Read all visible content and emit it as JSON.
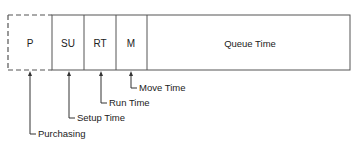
{
  "diagram": {
    "segments": [
      {
        "id": "p",
        "label": "P",
        "style": "dashed"
      },
      {
        "id": "su",
        "label": "SU",
        "style": "solid"
      },
      {
        "id": "rt",
        "label": "RT",
        "style": "solid"
      },
      {
        "id": "m",
        "label": "M",
        "style": "solid"
      },
      {
        "id": "queue",
        "label": "Queue Time",
        "style": "solid"
      }
    ],
    "callouts": [
      {
        "target": "M",
        "label": "Move Time"
      },
      {
        "target": "RT",
        "label": "Run Time"
      },
      {
        "target": "SU",
        "label": "Setup Time"
      },
      {
        "target": "P",
        "label": "Purchasing"
      }
    ]
  }
}
